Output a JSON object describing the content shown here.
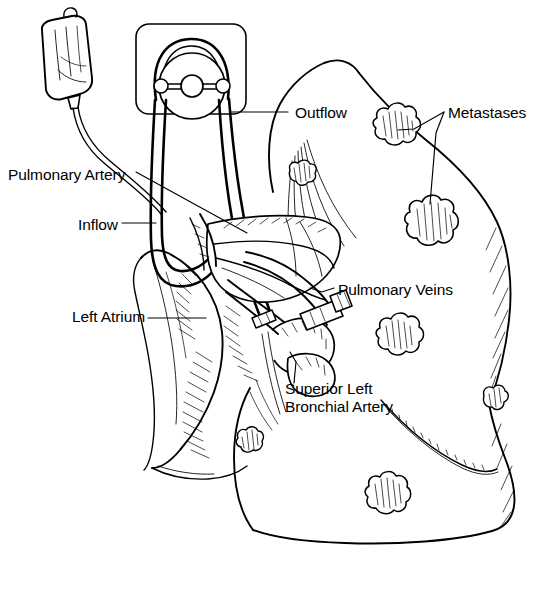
{
  "figure": {
    "ink_color": "#000000",
    "background_color": "#ffffff",
    "style": "line-art pen-and-ink medical illustration"
  },
  "labels": [
    {
      "id": "outflow",
      "text": "Outflow",
      "x": 295,
      "y": 104,
      "anchor": "left"
    },
    {
      "id": "metastases",
      "text": "Metastases",
      "x": 448,
      "y": 104,
      "anchor": "left"
    },
    {
      "id": "pulmonary-artery",
      "text": "Pulmonary Artery",
      "x": 8,
      "y": 166,
      "anchor": "left"
    },
    {
      "id": "inflow",
      "text": "Inflow",
      "x": 78,
      "y": 216,
      "anchor": "left"
    },
    {
      "id": "pulmonary-veins",
      "text": "Pulmonary Veins",
      "x": 338,
      "y": 281,
      "anchor": "left"
    },
    {
      "id": "left-atrium",
      "text": "Left Atrium",
      "x": 72,
      "y": 308,
      "anchor": "left"
    }
  ],
  "multiline_labels": [
    {
      "id": "superior-left-bronchial-artery",
      "line1": "Superior Left",
      "line2": "Bronchial Artery",
      "x": 285,
      "y": 380
    }
  ],
  "parts": {
    "perfusate_bag": "perfusate-bag",
    "pump": "roller-pump",
    "pump_housing": "pump-housing-panel",
    "inflow_tubing": "inflow-tubing",
    "outflow_tubing": "outflow-tubing",
    "lung": "left-lung-outline",
    "hilum": "pulmonary-hilum",
    "left_atrium": "left-atrium-cuff",
    "oblique_fissure": "oblique-fissure",
    "nodules": "metastatic-nodules"
  },
  "metastases": [
    {
      "id": "met-upper-right",
      "cx": 393,
      "cy": 128,
      "rx": 20,
      "ry": 17,
      "labeled": true
    },
    {
      "id": "met-mid-left",
      "cx": 300,
      "cy": 175,
      "rx": 13,
      "ry": 11,
      "labeled": false
    },
    {
      "id": "met-right-large",
      "cx": 430,
      "cy": 222,
      "rx": 22,
      "ry": 19,
      "labeled": true
    },
    {
      "id": "met-mid-right",
      "cx": 396,
      "cy": 337,
      "rx": 20,
      "ry": 17,
      "labeled": false
    },
    {
      "id": "met-far-right",
      "cx": 493,
      "cy": 403,
      "rx": 13,
      "ry": 13,
      "labeled": false
    },
    {
      "id": "met-lower-left",
      "cx": 248,
      "cy": 443,
      "rx": 14,
      "ry": 12,
      "labeled": false
    },
    {
      "id": "met-lower-mid",
      "cx": 385,
      "cy": 494,
      "rx": 19,
      "ry": 16,
      "labeled": false
    }
  ],
  "leader_lines": [
    {
      "id": "leader-outflow",
      "from": "outflow-label",
      "to": "outflow-tubing"
    },
    {
      "id": "leader-metastases-upper",
      "from": "metastases-label",
      "to": "met-upper-right"
    },
    {
      "id": "leader-metastases-lower",
      "from": "metastases-label",
      "to": "met-right-large"
    },
    {
      "id": "leader-pulmonary-artery",
      "from": "pulmonary-artery-label",
      "to": "pulmonary-hilum"
    },
    {
      "id": "leader-inflow",
      "from": "inflow-label",
      "to": "inflow-tubing"
    },
    {
      "id": "leader-pulmonary-veins",
      "from": "pulmonary-veins-label",
      "to": "pulmonary-veins"
    },
    {
      "id": "leader-left-atrium",
      "from": "left-atrium-label",
      "to": "left-atrium-cuff"
    },
    {
      "id": "leader-bronchial-artery",
      "from": "bronchial-artery-label",
      "to": "superior-left-bronchial-artery"
    }
  ]
}
